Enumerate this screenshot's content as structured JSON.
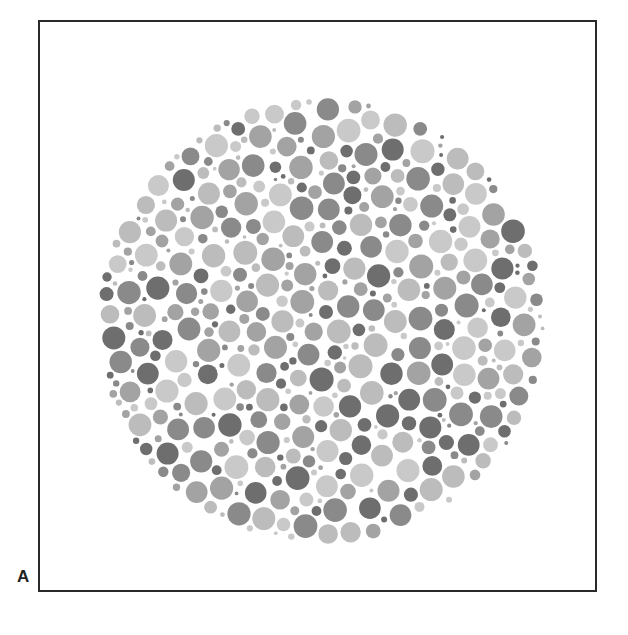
{
  "figure": {
    "panel_label": "A",
    "plate": {
      "center_x": 321,
      "center_y": 321,
      "radius": 224,
      "dot_colors": [
        "#6e6e6e",
        "#8a8a8a",
        "#a3a3a3",
        "#bcbcbc",
        "#c9c9c9"
      ],
      "dot_radius_min": 3,
      "dot_radius_max": 12,
      "seed": 7
    },
    "colors": {
      "frame": "#2a2a2a",
      "background": "#ffffff"
    }
  }
}
